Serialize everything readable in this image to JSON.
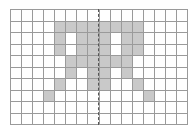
{
  "grid": {
    "columns": 16,
    "rows": 10,
    "fill_color": "#c9c9c9",
    "empty_color": "#ffffff",
    "line_color": "#9a9a9a",
    "symmetry_axis": "vertical-center-dashed",
    "filled_cells": [
      [
        1,
        4
      ],
      [
        1,
        5
      ],
      [
        1,
        6
      ],
      [
        1,
        7
      ],
      [
        1,
        8
      ],
      [
        1,
        9
      ],
      [
        1,
        10
      ],
      [
        1,
        11
      ],
      [
        2,
        4
      ],
      [
        2,
        6
      ],
      [
        2,
        7
      ],
      [
        2,
        8
      ],
      [
        2,
        10
      ],
      [
        2,
        11
      ],
      [
        3,
        4
      ],
      [
        3,
        6
      ],
      [
        3,
        7
      ],
      [
        3,
        8
      ],
      [
        3,
        10
      ],
      [
        3,
        11
      ],
      [
        4,
        5
      ],
      [
        4,
        6
      ],
      [
        4,
        7
      ],
      [
        4,
        8
      ],
      [
        4,
        9
      ],
      [
        4,
        10
      ],
      [
        5,
        5
      ],
      [
        5,
        7
      ],
      [
        5,
        8
      ],
      [
        5,
        10
      ],
      [
        6,
        4
      ],
      [
        6,
        7
      ],
      [
        6,
        8
      ],
      [
        6,
        11
      ],
      [
        7,
        3
      ],
      [
        7,
        12
      ]
    ]
  }
}
